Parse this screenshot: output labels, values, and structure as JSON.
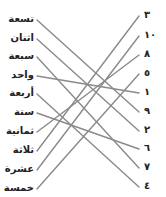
{
  "diagram": {
    "type": "matching-exercise",
    "line_color": "#8a8a8a",
    "left_words": [
      {
        "label": "تسعة",
        "y": 19
      },
      {
        "label": "اثنان",
        "y": 38
      },
      {
        "label": "سبعة",
        "y": 56
      },
      {
        "label": "واحد",
        "y": 75
      },
      {
        "label": "أربعة",
        "y": 93
      },
      {
        "label": "ستة",
        "y": 112
      },
      {
        "label": "ثمانية",
        "y": 131
      },
      {
        "label": "ثلاثة",
        "y": 150
      },
      {
        "label": "عشرة",
        "y": 169
      },
      {
        "label": "خمسة",
        "y": 188
      }
    ],
    "right_numbers": [
      {
        "label": "٣",
        "y": 15
      },
      {
        "label": "١٠",
        "y": 35
      },
      {
        "label": "٨",
        "y": 54
      },
      {
        "label": "٥",
        "y": 73
      },
      {
        "label": "١",
        "y": 92
      },
      {
        "label": "٩",
        "y": 111
      },
      {
        "label": "٢",
        "y": 130
      },
      {
        "label": "٦",
        "y": 148
      },
      {
        "label": "٧",
        "y": 167
      },
      {
        "label": "٤",
        "y": 186
      }
    ],
    "connections": [
      {
        "from": 0,
        "to": 5
      },
      {
        "from": 1,
        "to": 6
      },
      {
        "from": 2,
        "to": 8
      },
      {
        "from": 3,
        "to": 4
      },
      {
        "from": 4,
        "to": 9
      },
      {
        "from": 5,
        "to": 7
      },
      {
        "from": 6,
        "to": 2
      },
      {
        "from": 7,
        "to": 0
      },
      {
        "from": 8,
        "to": 1
      },
      {
        "from": 9,
        "to": 3
      }
    ]
  }
}
